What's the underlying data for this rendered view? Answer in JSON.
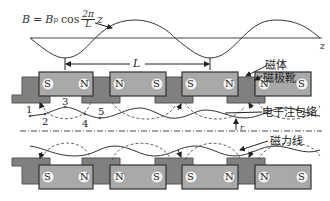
{
  "formula": {
    "lhs": "B",
    "eq": "=",
    "amp": "B",
    "amp_sub": "p",
    "func": "cos",
    "frac_num": "2π",
    "frac_den": "L",
    "var": "z"
  },
  "axis_label": "z",
  "period_label": "L",
  "labels": {
    "magnet": "磁体",
    "pole_shoe": "磁极靴",
    "beam_envelope": "电子注包络",
    "field_lines": "磁力线",
    "radius": "r"
  },
  "path_points": [
    "1",
    "2",
    "3",
    "4",
    "5"
  ],
  "top_magnets": [
    {
      "left": "S",
      "right": "N"
    },
    {
      "left": "N",
      "right": "S"
    },
    {
      "left": "S",
      "right": "N"
    },
    {
      "left": "N",
      "right": "S"
    }
  ],
  "bottom_magnets": [
    {
      "left": "S",
      "right": "N"
    },
    {
      "left": "N",
      "right": "S"
    },
    {
      "left": "S",
      "right": "N"
    },
    {
      "left": "N",
      "right": "S"
    }
  ],
  "colors": {
    "magnet_fill": "#a9a9a9",
    "pole_fill": "#808080",
    "outline": "#333333",
    "line": "#444444"
  }
}
